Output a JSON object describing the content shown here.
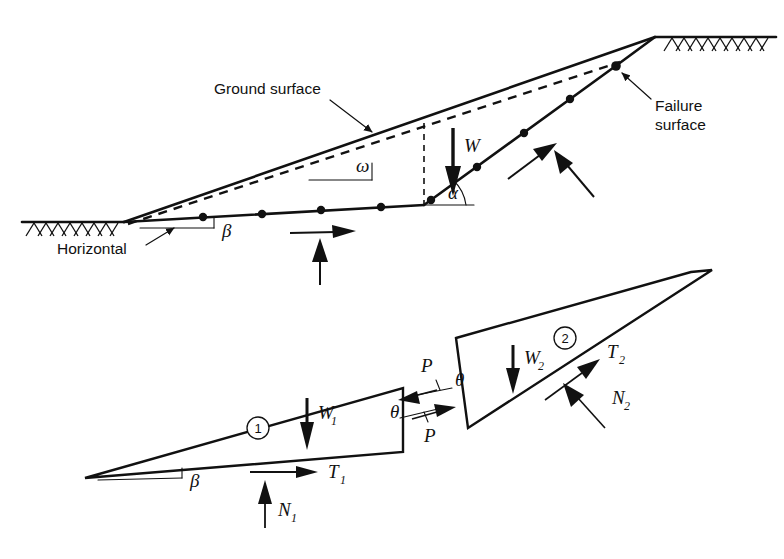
{
  "figure": {
    "kind": "engineering-diagram",
    "background_color": "#ffffff",
    "line_color": "#111111"
  },
  "upper_diagram": {
    "name": "slope-cross-section",
    "labels": {
      "ground_surface": "Ground surface",
      "failure_surface_line1": "Failure",
      "failure_surface_line2": "surface",
      "horizontal": "Horizontal"
    },
    "symbols": {
      "omega": "ω",
      "alpha": "α",
      "beta": "β",
      "weight": "W"
    },
    "annotations": {
      "omega_meaning": "ground-surface-inclination-angle",
      "alpha_meaning": "upper-failure-plane-inclination-angle",
      "beta_meaning": "lower-failure-plane-inclination-angle",
      "weight_meaning": "total-weight-vector"
    }
  },
  "lower_diagram": {
    "name": "free-body-wedges",
    "wedge_one": {
      "tag": "1",
      "weight": "W",
      "weight_sub": "1",
      "shear": "T",
      "shear_sub": "1",
      "normal": "N",
      "normal_sub": "1",
      "base_angle": "β"
    },
    "wedge_two": {
      "tag": "2",
      "weight": "W",
      "weight_sub": "2",
      "shear": "T",
      "shear_sub": "2",
      "normal": "N",
      "normal_sub": "2"
    },
    "interface": {
      "force_upper": "P",
      "force_lower": "P",
      "angle_upper": "θ",
      "angle_lower": "θ",
      "meaning": "interslice-force-inclined-at-theta"
    }
  }
}
